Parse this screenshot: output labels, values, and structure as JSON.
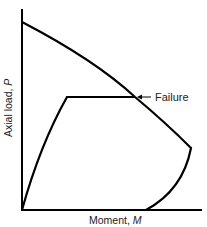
{
  "diagram": {
    "type": "interaction-diagram",
    "axes": {
      "x_label": "Moment, ",
      "x_symbol": "M",
      "y_label": "Axial load, ",
      "y_symbol": "P"
    },
    "annotations": {
      "failure_label": "Failure"
    },
    "curves": [
      {
        "name": "interaction-envelope",
        "description": "Failure envelope from pure axial load, through balance point, to pure bending"
      },
      {
        "name": "loading-path",
        "description": "Load path rising from origin then moving horizontally at constant P to failure"
      }
    ],
    "colors": {
      "line": "#000000",
      "text": "#222222",
      "background": "#ffffff"
    }
  }
}
